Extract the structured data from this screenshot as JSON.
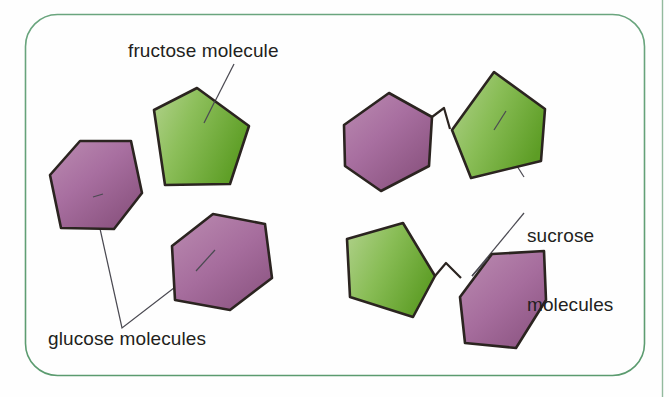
{
  "figure": {
    "type": "diagram",
    "background_color": "#fefefe",
    "border_color": "#5d9b72",
    "edge_rule_color": "#8fb79a"
  },
  "labels": {
    "fructose": "fructose molecule",
    "glucose": "glucose molecules",
    "sucrose_line1": "sucrose",
    "sucrose_line2": "molecules"
  },
  "colors": {
    "green_light": "#a9cd7f",
    "green_mid": "#8cbf58",
    "green_dark": "#63a32a",
    "purple_light": "#b886ae",
    "purple_mid": "#a66f9b",
    "purple_dark": "#8b5480",
    "outline": "#2b2420",
    "leader_line": "#4b4a52",
    "text": "#231f20"
  },
  "shapes": [
    {
      "name": "fructose-pentagon",
      "molecule": "fructose",
      "sides": 5,
      "fill": "green",
      "points": "154,110 197,88 249,126 230,184 165,185"
    },
    {
      "name": "glucose-hexagon-left",
      "molecule": "glucose",
      "sides": 6,
      "fill": "purple",
      "points": "50,175 80,141 131,141 142,193 114,229 61,228"
    },
    {
      "name": "glucose-hexagon-right",
      "molecule": "glucose",
      "sides": 6,
      "fill": "purple",
      "points": "172,246 213,214 265,224 272,278 230,310 175,300"
    },
    {
      "name": "sucrose-top-glucose-hexagon",
      "molecule": "glucose",
      "sides": 6,
      "fill": "purple",
      "points": "344,125 389,93 432,117 429,166 381,191 345,166"
    },
    {
      "name": "sucrose-top-fructose-pentagon",
      "molecule": "fructose",
      "sides": 5,
      "fill": "green",
      "points": "452,130 494,72 545,109 541,161 471,178"
    },
    {
      "name": "sucrose-bottom-fructose-pentagon",
      "molecule": "fructose",
      "sides": 5,
      "fill": "green",
      "points": "347,239 403,223 435,276 413,317 350,297"
    },
    {
      "name": "sucrose-bottom-glucose-hexagon",
      "molecule": "glucose",
      "sides": 6,
      "fill": "purple",
      "points": "460,297 492,254 544,251 546,300 516,348 465,343"
    }
  ],
  "bonds": [
    {
      "name": "glycosidic-bond-top",
      "path": "M432,117 L444,108 L450,129"
    },
    {
      "name": "glycosidic-bond-bottom",
      "path": "M435,276 L446,263 L461,278"
    }
  ],
  "leader_lines": [
    {
      "name": "fructose-leader",
      "path": "M234,64 L204,123"
    },
    {
      "name": "glucose-leader",
      "path": "M93,197 L122,328 L196,271"
    },
    {
      "name": "sucrose-leader-top",
      "path": "M524,177 L494,130"
    },
    {
      "name": "sucrose-leader-bottom",
      "path": "M524,213 L472,276"
    }
  ]
}
